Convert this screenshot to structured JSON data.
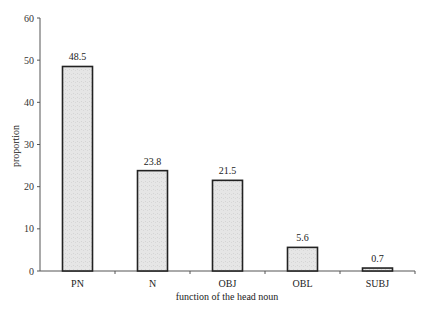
{
  "chart_data": {
    "type": "bar",
    "title": "",
    "xlabel": "function of the head noun",
    "ylabel": "proportion",
    "categories": [
      "PN",
      "N",
      "OBJ",
      "OBL",
      "SUBJ"
    ],
    "values": [
      48.5,
      23.8,
      21.5,
      5.6,
      0.7
    ],
    "value_labels": [
      "48.5",
      "23.8",
      "21.5",
      "5.6",
      "0.7"
    ],
    "ylim": [
      0,
      60
    ],
    "yticks": [
      0,
      10,
      20,
      30,
      40,
      50,
      60
    ],
    "grid": false,
    "legend": "none",
    "colors": {
      "bar_fill": "#e4e4e4",
      "bar_stroke": "#222222",
      "axis": "#555555"
    }
  }
}
